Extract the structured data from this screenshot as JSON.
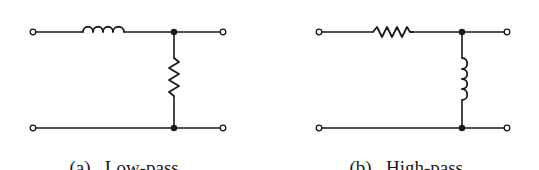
{
  "figure": {
    "background": "#ffffff",
    "ink_color": "#1a1a1a",
    "panels": [
      {
        "id": "a",
        "tag": "(a)",
        "title": "Low-pass",
        "series_element": "inductor",
        "shunt_element": "resistor"
      },
      {
        "id": "b",
        "tag": "(b)",
        "title": "High-pass",
        "series_element": "resistor",
        "shunt_element": "inductor"
      }
    ]
  }
}
